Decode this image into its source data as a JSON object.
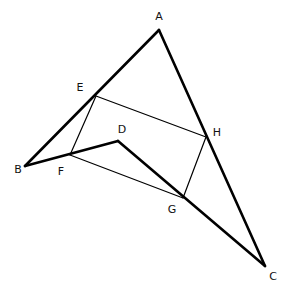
{
  "diagram": {
    "type": "geometry",
    "points": {
      "A": {
        "x": 159,
        "y": 30,
        "label": "A",
        "lx": 159,
        "ly": 17
      },
      "B": {
        "x": 25,
        "y": 166,
        "label": "B",
        "lx": 18,
        "ly": 170
      },
      "C": {
        "x": 265,
        "y": 266,
        "label": "C",
        "lx": 273,
        "ly": 277
      },
      "D": {
        "x": 118,
        "y": 141,
        "label": "D",
        "lx": 122,
        "ly": 130
      },
      "E": {
        "x": 96,
        "y": 96,
        "label": "E",
        "lx": 80,
        "ly": 88
      },
      "F": {
        "x": 70,
        "y": 155,
        "label": "F",
        "lx": 61,
        "ly": 172
      },
      "G": {
        "x": 183,
        "y": 198,
        "label": "G",
        "lx": 172,
        "ly": 210
      },
      "H": {
        "x": 206,
        "y": 137,
        "label": "H",
        "lx": 217,
        "ly": 133
      }
    },
    "labels": [
      "A",
      "B",
      "C",
      "D",
      "E",
      "F",
      "G",
      "H"
    ],
    "thick_segments": [
      [
        "A",
        "B"
      ],
      [
        "A",
        "C"
      ],
      [
        "B",
        "D"
      ],
      [
        "D",
        "C"
      ]
    ],
    "thin_segments": [
      [
        "E",
        "H"
      ],
      [
        "H",
        "G"
      ],
      [
        "G",
        "F"
      ],
      [
        "F",
        "E"
      ]
    ]
  }
}
